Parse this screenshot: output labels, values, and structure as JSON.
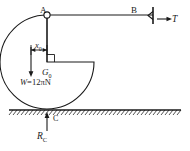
{
  "figure": {
    "stroke_color": "#1a1a1a",
    "ground_color": "#1a1a1a"
  },
  "labels": {
    "point_a": "A",
    "point_b": "B",
    "tension": "T",
    "dimension_x0_main": "x",
    "dimension_x0_sub": "0",
    "centroid_main": "G",
    "centroid_sub": "0",
    "weight_prefix": "W",
    "weight_equals": "=12",
    "weight_pi": "π",
    "weight_unit": "N",
    "point_c": "C",
    "reaction_main": "R",
    "reaction_sub": "C"
  },
  "geometry": {
    "circle_center_x": 47,
    "circle_center_y": 62,
    "circle_radius": 47,
    "point_a_x": 47,
    "point_a_y": 15,
    "point_b_x": 152,
    "point_b_y": 15,
    "point_c_x": 47,
    "point_c_y": 109,
    "cut_corner_x": 47,
    "cut_corner_y": 62,
    "ground_y": 110,
    "ground_left": 9,
    "ground_right": 181
  }
}
